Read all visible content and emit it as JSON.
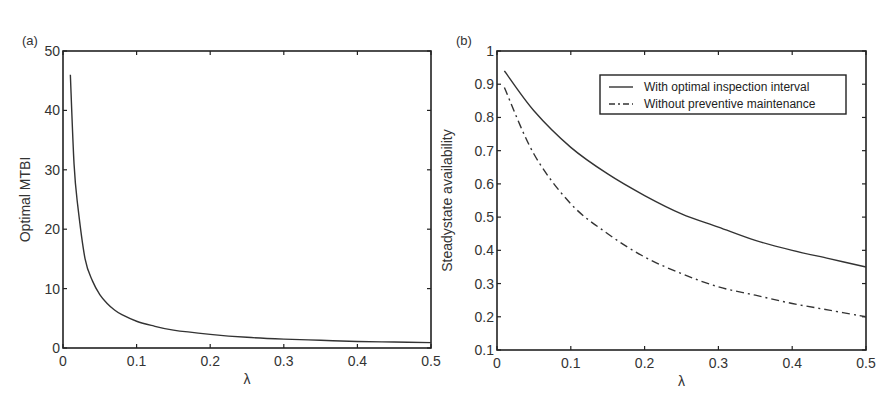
{
  "chart_data": [
    {
      "panel_label": "(a)",
      "type": "line",
      "title": "",
      "xlabel": "λ",
      "ylabel": "Optimal MTBI",
      "xlim": [
        0,
        0.5
      ],
      "ylim": [
        0,
        50
      ],
      "xticks": [
        "0",
        "0.1",
        "0.2",
        "0.3",
        "0.4",
        "0.5"
      ],
      "yticks": [
        "0",
        "10",
        "20",
        "30",
        "40",
        "50"
      ],
      "grid": false,
      "legend": null,
      "series": [
        {
          "name": "Optimal MTBI",
          "style": "solid",
          "x": [
            0.01,
            0.015,
            0.02,
            0.03,
            0.04,
            0.05,
            0.06,
            0.07,
            0.08,
            0.1,
            0.12,
            0.15,
            0.2,
            0.25,
            0.3,
            0.35,
            0.4,
            0.45,
            0.5
          ],
          "y": [
            46,
            31,
            24,
            15,
            11.3,
            9.0,
            7.5,
            6.4,
            5.6,
            4.5,
            3.8,
            3.0,
            2.3,
            1.8,
            1.5,
            1.3,
            1.1,
            1.0,
            0.9
          ]
        }
      ]
    },
    {
      "panel_label": "(b)",
      "type": "line",
      "title": "",
      "xlabel": "λ",
      "ylabel": "Steadystate availability",
      "xlim": [
        0,
        0.5
      ],
      "ylim": [
        0.1,
        1
      ],
      "xticks": [
        "0",
        "0.1",
        "0.2",
        "0.3",
        "0.4",
        "0.5"
      ],
      "yticks": [
        "0.1",
        "0.2",
        "0.3",
        "0.4",
        "0.5",
        "0.6",
        "0.7",
        "0.8",
        "0.9",
        "1"
      ],
      "grid": false,
      "legend": {
        "position": "upper right"
      },
      "series": [
        {
          "name": "With optimal inspection interval",
          "style": "solid",
          "x": [
            0.01,
            0.05,
            0.1,
            0.15,
            0.2,
            0.25,
            0.3,
            0.35,
            0.4,
            0.45,
            0.5
          ],
          "y": [
            0.94,
            0.82,
            0.71,
            0.63,
            0.565,
            0.51,
            0.47,
            0.43,
            0.4,
            0.375,
            0.35
          ]
        },
        {
          "name": "Without preventive maintenance",
          "style": "dashdot",
          "x": [
            0.01,
            0.05,
            0.1,
            0.15,
            0.2,
            0.25,
            0.3,
            0.35,
            0.4,
            0.45,
            0.5
          ],
          "y": [
            0.89,
            0.69,
            0.54,
            0.45,
            0.38,
            0.33,
            0.29,
            0.265,
            0.24,
            0.22,
            0.2
          ]
        }
      ]
    }
  ]
}
